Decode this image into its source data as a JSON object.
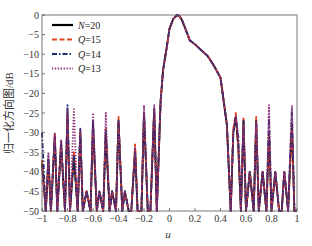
{
  "chart_data": {
    "type": "line",
    "title": "",
    "xlabel": "u",
    "ylabel": "归一化方向图/dB",
    "xlim": [
      -1,
      1
    ],
    "ylim": [
      -50,
      0
    ],
    "grid": false,
    "legend_position": "upper left",
    "x_ticks": [
      "-1",
      "-0.8",
      "-0.6",
      "-0.4",
      "-0.2",
      "0",
      "0.2",
      "0.4",
      "0.6",
      "0.8",
      "1"
    ],
    "y_ticks": [
      "0",
      "-5",
      "-10",
      "-15",
      "-20",
      "-25",
      "-30",
      "-35",
      "-40",
      "-45",
      "-50"
    ],
    "series": [
      {
        "name": "N=20",
        "color": "#000000",
        "style": "solid",
        "x": [
          -1,
          -0.97,
          -0.95,
          -0.93,
          -0.9,
          -0.88,
          -0.85,
          -0.82,
          -0.8,
          -0.78,
          -0.75,
          -0.72,
          -0.7,
          -0.68,
          -0.65,
          -0.62,
          -0.6,
          -0.57,
          -0.55,
          -0.52,
          -0.5,
          -0.47,
          -0.45,
          -0.42,
          -0.4,
          -0.37,
          -0.35,
          -0.32,
          -0.3,
          -0.27,
          -0.25,
          -0.22,
          -0.2,
          -0.17,
          -0.15,
          -0.12,
          -0.1,
          -0.07,
          -0.05,
          -0.02,
          0,
          0.03,
          0.06,
          0.08,
          0.1,
          0.13,
          0.16,
          0.2,
          0.25,
          0.3,
          0.35,
          0.4,
          0.45,
          0.48,
          0.5,
          0.52,
          0.54,
          0.56,
          0.58,
          0.6,
          0.63,
          0.66,
          0.68,
          0.7,
          0.73,
          0.76,
          0.78,
          0.8,
          0.83,
          0.86,
          0.88,
          0.9,
          0.93,
          0.96,
          0.98,
          1
        ],
        "y": [
          -38,
          -50,
          -37,
          -50,
          -31,
          -50,
          -33,
          -50,
          -25,
          -50,
          -36,
          -50,
          -30,
          -50,
          -45,
          -50,
          -28,
          -50,
          -45,
          -50,
          -30,
          -50,
          -45,
          -50,
          -27,
          -50,
          -45,
          -50,
          -50,
          -34,
          -50,
          -50,
          -25,
          -50,
          -50,
          -24,
          -50,
          -22,
          -14,
          -8,
          -3.5,
          -1,
          0,
          -0.3,
          -1.5,
          -4,
          -6.5,
          -7.5,
          -9,
          -10.5,
          -13,
          -16,
          -28,
          -50,
          -30,
          -26,
          -34,
          -50,
          -27,
          -50,
          -40,
          -50,
          -27,
          -50,
          -40,
          -50,
          -30,
          -50,
          -40,
          -50,
          -50,
          -40,
          -50,
          -28,
          -50,
          -50
        ]
      },
      {
        "name": "Q=15",
        "color": "#e2401c",
        "style": "dashed",
        "x": [
          -1,
          -0.97,
          -0.95,
          -0.93,
          -0.9,
          -0.88,
          -0.85,
          -0.82,
          -0.8,
          -0.78,
          -0.75,
          -0.72,
          -0.7,
          -0.68,
          -0.65,
          -0.62,
          -0.6,
          -0.57,
          -0.55,
          -0.52,
          -0.5,
          -0.47,
          -0.45,
          -0.42,
          -0.4,
          -0.37,
          -0.35,
          -0.32,
          -0.3,
          -0.27,
          -0.25,
          -0.22,
          -0.2,
          -0.17,
          -0.15,
          -0.12,
          -0.1,
          -0.07,
          -0.05,
          -0.02,
          0,
          0.03,
          0.06,
          0.08,
          0.1,
          0.13,
          0.16,
          0.2,
          0.25,
          0.3,
          0.35,
          0.4,
          0.45,
          0.48,
          0.5,
          0.52,
          0.54,
          0.56,
          0.58,
          0.6,
          0.63,
          0.66,
          0.68,
          0.7,
          0.73,
          0.76,
          0.78,
          0.8,
          0.83,
          0.86,
          0.88,
          0.9,
          0.93,
          0.96,
          0.98,
          1
        ],
        "y": [
          -37,
          -50,
          -38,
          -50,
          -30,
          -50,
          -33,
          -50,
          -26,
          -50,
          -35,
          -50,
          -30,
          -50,
          -45,
          -50,
          -29,
          -50,
          -45,
          -50,
          -29,
          -50,
          -45,
          -50,
          -26,
          -50,
          -45,
          -50,
          -50,
          -33,
          -50,
          -50,
          -25,
          -50,
          -50,
          -24,
          -50,
          -22,
          -14,
          -8,
          -3.5,
          -1,
          0,
          -0.3,
          -1.5,
          -4,
          -6.5,
          -7.5,
          -9,
          -10.5,
          -13,
          -16,
          -28,
          -50,
          -29,
          -25,
          -34,
          -50,
          -26,
          -50,
          -40,
          -50,
          -26,
          -50,
          -40,
          -50,
          -31,
          -50,
          -40,
          -50,
          -50,
          -40,
          -50,
          -29,
          -50,
          -50
        ]
      },
      {
        "name": "Q=14",
        "color": "#1f2a6b",
        "style": "dashdot",
        "x": [
          -1,
          -0.97,
          -0.95,
          -0.93,
          -0.9,
          -0.88,
          -0.85,
          -0.82,
          -0.8,
          -0.78,
          -0.75,
          -0.72,
          -0.7,
          -0.68,
          -0.65,
          -0.62,
          -0.6,
          -0.57,
          -0.55,
          -0.52,
          -0.5,
          -0.47,
          -0.45,
          -0.42,
          -0.4,
          -0.37,
          -0.35,
          -0.32,
          -0.3,
          -0.27,
          -0.25,
          -0.22,
          -0.2,
          -0.17,
          -0.15,
          -0.12,
          -0.1,
          -0.07,
          -0.05,
          -0.02,
          0,
          0.03,
          0.06,
          0.08,
          0.1,
          0.13,
          0.16,
          0.2,
          0.25,
          0.3,
          0.35,
          0.4,
          0.45,
          0.48,
          0.5,
          0.52,
          0.54,
          0.56,
          0.58,
          0.6,
          0.63,
          0.66,
          0.68,
          0.7,
          0.73,
          0.76,
          0.78,
          0.8,
          0.83,
          0.86,
          0.88,
          0.9,
          0.93,
          0.96,
          0.98,
          1
        ],
        "y": [
          -30,
          -50,
          -36,
          -50,
          -31,
          -50,
          -32,
          -50,
          -23,
          -50,
          -36,
          -50,
          -29,
          -50,
          -45,
          -50,
          -27,
          -50,
          -45,
          -50,
          -29,
          -50,
          -45,
          -50,
          -27,
          -50,
          -45,
          -50,
          -50,
          -35,
          -50,
          -50,
          -25,
          -50,
          -50,
          -24,
          -50,
          -22,
          -14,
          -8,
          -3.5,
          -1,
          0,
          -0.3,
          -1.5,
          -4,
          -6.5,
          -7.5,
          -9,
          -10.5,
          -13,
          -16,
          -28,
          -50,
          -30,
          -26,
          -31,
          -50,
          -27,
          -50,
          -40,
          -50,
          -27,
          -50,
          -40,
          -50,
          -26,
          -50,
          -40,
          -50,
          -50,
          -40,
          -50,
          -24,
          -50,
          -50
        ]
      },
      {
        "name": "Q=13",
        "color": "#8e2e78",
        "style": "dotted",
        "x": [
          -1,
          -0.97,
          -0.95,
          -0.93,
          -0.9,
          -0.88,
          -0.85,
          -0.82,
          -0.8,
          -0.78,
          -0.75,
          -0.72,
          -0.7,
          -0.68,
          -0.65,
          -0.62,
          -0.6,
          -0.57,
          -0.55,
          -0.52,
          -0.5,
          -0.47,
          -0.45,
          -0.42,
          -0.4,
          -0.37,
          -0.35,
          -0.32,
          -0.3,
          -0.27,
          -0.25,
          -0.22,
          -0.2,
          -0.17,
          -0.15,
          -0.12,
          -0.1,
          -0.07,
          -0.05,
          -0.02,
          0,
          0.03,
          0.06,
          0.08,
          0.1,
          0.13,
          0.16,
          0.2,
          0.25,
          0.3,
          0.35,
          0.4,
          0.45,
          0.48,
          0.5,
          0.52,
          0.54,
          0.56,
          0.58,
          0.6,
          0.63,
          0.66,
          0.68,
          0.7,
          0.73,
          0.76,
          0.78,
          0.8,
          0.83,
          0.86,
          0.88,
          0.9,
          0.93,
          0.96,
          0.98,
          1
        ],
        "y": [
          -38,
          -50,
          -35,
          -50,
          -30,
          -50,
          -32,
          -50,
          -24,
          -50,
          -24,
          -50,
          -29,
          -50,
          -45,
          -50,
          -25,
          -50,
          -45,
          -50,
          -25,
          -50,
          -45,
          -50,
          -27,
          -50,
          -45,
          -50,
          -50,
          -34,
          -50,
          -50,
          -23,
          -50,
          -50,
          -23,
          -50,
          -22,
          -14,
          -8,
          -3.5,
          -1,
          0,
          -0.3,
          -1.5,
          -4,
          -6.5,
          -7.5,
          -9,
          -10.5,
          -13,
          -16,
          -28,
          -50,
          -30,
          -26,
          -31,
          -50,
          -28,
          -50,
          -40,
          -50,
          -28,
          -50,
          -40,
          -50,
          -23,
          -50,
          -40,
          -50,
          -50,
          -40,
          -50,
          -23,
          -50,
          -50
        ]
      }
    ]
  },
  "legend": {
    "items": [
      {
        "var": "N",
        "value": "=20"
      },
      {
        "var": "Q",
        "value": "=15"
      },
      {
        "var": "Q",
        "value": "=14"
      },
      {
        "var": "Q",
        "value": "=13"
      }
    ]
  },
  "axes": {
    "xlabel": "u",
    "ylabel": "归一化方向图/dB"
  }
}
